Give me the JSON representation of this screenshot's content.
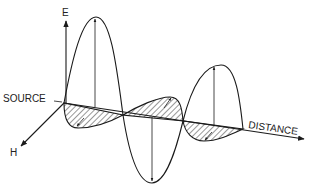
{
  "diagram": {
    "labels": {
      "e_axis": "E",
      "h_axis": "H",
      "source": "SOURCE",
      "distance": "DISTANCE"
    },
    "components": [
      {
        "name": "electric-field-wave",
        "style": "outline",
        "orientation": "vertical"
      },
      {
        "name": "magnetic-field-wave",
        "style": "hatched",
        "orientation": "horizontal-perspective"
      }
    ],
    "colors": {
      "ink": "#1a1a1a",
      "background": "#ffffff"
    }
  }
}
